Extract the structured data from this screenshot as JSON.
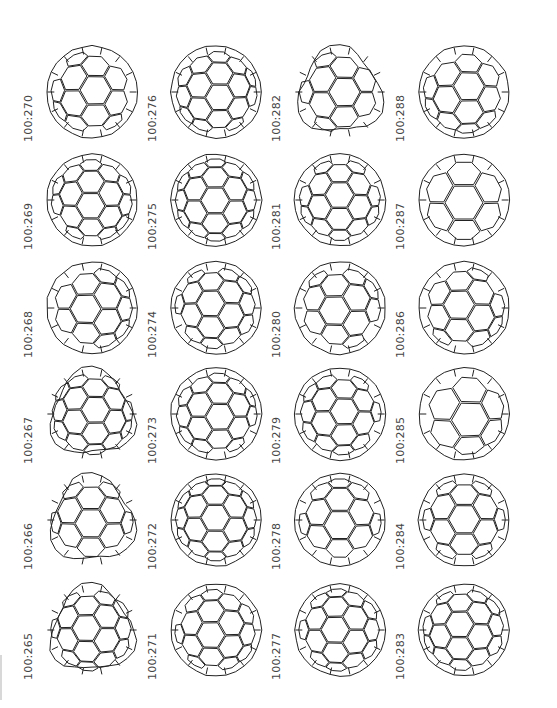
{
  "figure": {
    "columns": [
      {
        "labels": [
          "100:270",
          "100:269",
          "100:268",
          "100:267",
          "100:266",
          "100:265"
        ]
      },
      {
        "labels": [
          "100:276",
          "100:275",
          "100:274",
          "100:273",
          "100:272",
          "100:271"
        ]
      },
      {
        "labels": [
          "100:282",
          "100:281",
          "100:280",
          "100:279",
          "100:278",
          "100:277"
        ]
      },
      {
        "labels": [
          "100:288",
          "100:287",
          "100:286",
          "100:285",
          "100:284",
          "100:283"
        ]
      }
    ],
    "cells": [
      {
        "col": 0,
        "row": 0,
        "label": "100:270",
        "shape": "round"
      },
      {
        "col": 0,
        "row": 1,
        "label": "100:269",
        "shape": "round"
      },
      {
        "col": 0,
        "row": 2,
        "label": "100:268",
        "shape": "round"
      },
      {
        "col": 0,
        "row": 3,
        "label": "100:267",
        "shape": "lumpy"
      },
      {
        "col": 0,
        "row": 4,
        "label": "100:266",
        "shape": "lumpy"
      },
      {
        "col": 0,
        "row": 5,
        "label": "100:265",
        "shape": "lumpy"
      },
      {
        "col": 1,
        "row": 0,
        "label": "100:276",
        "shape": "round"
      },
      {
        "col": 1,
        "row": 1,
        "label": "100:275",
        "shape": "round"
      },
      {
        "col": 1,
        "row": 2,
        "label": "100:274",
        "shape": "round"
      },
      {
        "col": 1,
        "row": 3,
        "label": "100:273",
        "shape": "round"
      },
      {
        "col": 1,
        "row": 4,
        "label": "100:272",
        "shape": "round"
      },
      {
        "col": 1,
        "row": 5,
        "label": "100:271",
        "shape": "round"
      },
      {
        "col": 2,
        "row": 0,
        "label": "100:282",
        "shape": "lumpy"
      },
      {
        "col": 2,
        "row": 1,
        "label": "100:281",
        "shape": "round"
      },
      {
        "col": 2,
        "row": 2,
        "label": "100:280",
        "shape": "round"
      },
      {
        "col": 2,
        "row": 3,
        "label": "100:279",
        "shape": "round"
      },
      {
        "col": 2,
        "row": 4,
        "label": "100:278",
        "shape": "round"
      },
      {
        "col": 2,
        "row": 5,
        "label": "100:277",
        "shape": "round"
      },
      {
        "col": 3,
        "row": 0,
        "label": "100:288",
        "shape": "round"
      },
      {
        "col": 3,
        "row": 1,
        "label": "100:287",
        "shape": "sparse"
      },
      {
        "col": 3,
        "row": 2,
        "label": "100:286",
        "shape": "round"
      },
      {
        "col": 3,
        "row": 3,
        "label": "100:285",
        "shape": "sparse"
      },
      {
        "col": 3,
        "row": 4,
        "label": "100:284",
        "shape": "round"
      },
      {
        "col": 3,
        "row": 5,
        "label": "100:283",
        "shape": "round"
      }
    ]
  },
  "style": {
    "line_color": "#222222",
    "label_color": "#444444",
    "background": "#ffffff"
  }
}
